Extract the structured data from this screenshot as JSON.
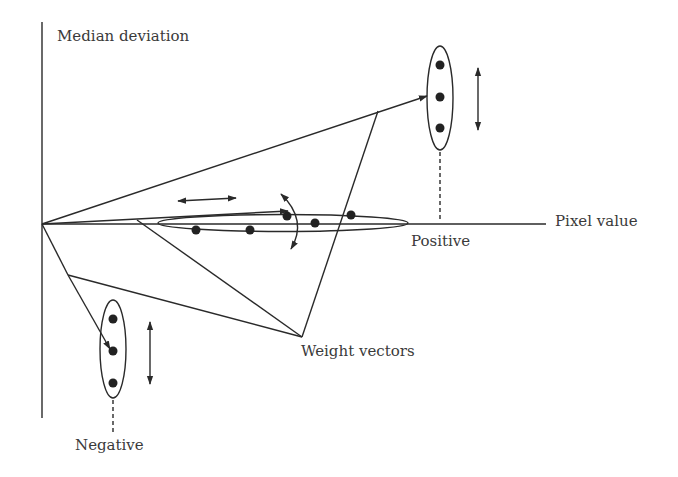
{
  "diagram": {
    "type": "feature-space schematic",
    "labels": {
      "y_axis": "Median deviation",
      "x_axis": "Pixel value",
      "positive": "Positive",
      "negative": "Negative",
      "weight_vectors": "Weight vectors"
    },
    "colors": {
      "line": "#2a2a2a",
      "text": "#3a3a3a",
      "background": "#ffffff"
    },
    "clusters": [
      {
        "name": "positive-cluster",
        "points": 3,
        "orientation": "vertical"
      },
      {
        "name": "negative-cluster",
        "points": 3,
        "orientation": "vertical"
      },
      {
        "name": "pixel-value-cluster",
        "points": 5,
        "orientation": "horizontal"
      }
    ]
  }
}
